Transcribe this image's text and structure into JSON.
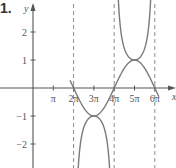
{
  "problem_label": "1.",
  "chart_data": {
    "type": "line",
    "title": "",
    "xlabel": "x",
    "ylabel": "y",
    "x_ticks": [
      "π",
      "2π",
      "3π",
      "4π",
      "5π",
      "6π"
    ],
    "x_tick_values_pi": [
      1,
      2,
      3,
      4,
      5,
      6
    ],
    "y_ticks": [
      "2",
      "1",
      "-1",
      "-2"
    ],
    "y_tick_values": [
      2,
      1,
      -1,
      -2
    ],
    "xlim_pi": [
      -0.3,
      7
    ],
    "ylim": [
      -2.7,
      3
    ],
    "grid": false,
    "asymptotes_x_pi": [
      2,
      4,
      6
    ],
    "series": [
      {
        "name": "sin(x/2)",
        "style": "solid",
        "points_x_pi": [
          2,
          3,
          4,
          5,
          6
        ],
        "points_y": [
          0,
          1,
          0,
          -1,
          0
        ]
      },
      {
        "name": "csc(x/2)",
        "style": "solid",
        "branches": [
          {
            "interval_pi": [
              2,
              4
            ],
            "vertex": [
              3,
              1
            ],
            "opens": "up"
          },
          {
            "interval_pi": [
              4,
              6
            ],
            "vertex": [
              5,
              -1
            ],
            "opens": "down"
          }
        ]
      }
    ]
  },
  "colors": {
    "curve": "#7a7a7a",
    "axis": "#555555",
    "asymptote": "#8a8a8a",
    "text": "#555555"
  }
}
